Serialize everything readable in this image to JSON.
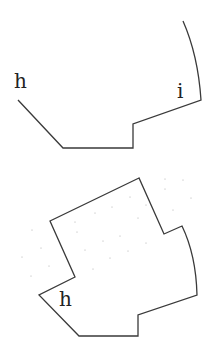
{
  "diagram": {
    "colors": {
      "stroke": "#3a3a3a",
      "label": "#222222",
      "background": "#ffffff",
      "dots": "#9a9a9a"
    },
    "figures": [
      {
        "id": "top-figure",
        "type": "open-polyline-with-arc",
        "labels": [
          {
            "text": "h",
            "x": 14,
            "y": 88
          },
          {
            "text": "i",
            "x": 177,
            "y": 98
          }
        ],
        "path": "M18,100 L63,148 L133,148 L133,124 L201,100 Q198,55 183,21"
      },
      {
        "id": "bottom-figure",
        "type": "closed-polygon-with-arc",
        "labels": [
          {
            "text": "h",
            "x": 59,
            "y": 306
          }
        ],
        "path": "M139,178 L50,221 L75,277 L39,295 L79,336 L138,336 L138,315 L197,295 Q196,255 182,226 L164,234 Z"
      }
    ]
  }
}
